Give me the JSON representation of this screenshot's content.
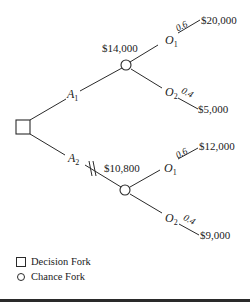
{
  "diagram": {
    "type": "decision-tree",
    "decision_node": {
      "shape": "square",
      "label": "Decision Fork"
    },
    "alternatives": [
      {
        "name": "A",
        "subscript": "1",
        "expected_value": "$14,000",
        "pruned": false,
        "outcomes": [
          {
            "name": "O",
            "subscript": "1",
            "probability": "0.6",
            "payoff": "$20,000"
          },
          {
            "name": "O",
            "subscript": "2",
            "probability": "0.4",
            "payoff": "$5,000"
          }
        ]
      },
      {
        "name": "A",
        "subscript": "2",
        "expected_value": "$10,800",
        "pruned": true,
        "outcomes": [
          {
            "name": "O",
            "subscript": "1",
            "probability": "0.6",
            "payoff": "$12,000"
          },
          {
            "name": "O",
            "subscript": "2",
            "probability": "0.4",
            "payoff": "$9,000"
          }
        ]
      }
    ]
  },
  "legend": {
    "items": [
      {
        "icon": "square-icon",
        "label": "Decision Fork"
      },
      {
        "icon": "circle-icon",
        "label": "Chance Fork"
      }
    ]
  }
}
